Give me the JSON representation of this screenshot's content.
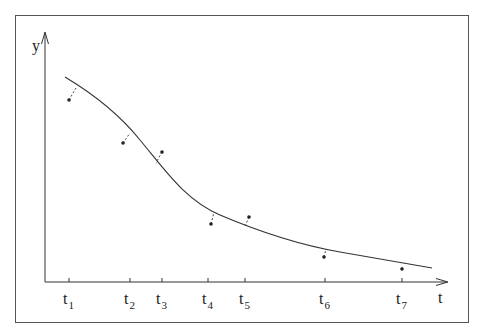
{
  "diagram": {
    "axes": {
      "y_label": "y",
      "x_label": "t"
    },
    "ticks": [
      {
        "base": "t",
        "sub": "1",
        "x": 69
      },
      {
        "base": "t",
        "sub": "2",
        "x": 130
      },
      {
        "base": "t",
        "sub": "3",
        "x": 162
      },
      {
        "base": "t",
        "sub": "4",
        "x": 208
      },
      {
        "base": "t",
        "sub": "5",
        "x": 245
      },
      {
        "base": "t",
        "sub": "6",
        "x": 325
      },
      {
        "base": "t",
        "sub": "7",
        "x": 402
      }
    ],
    "points": [
      {
        "x": 69,
        "y": 100,
        "cx": 76,
        "cy": 88
      },
      {
        "x": 123,
        "y": 143,
        "cx": 130,
        "cy": 133
      },
      {
        "x": 162,
        "y": 152,
        "cx": 156,
        "cy": 163
      },
      {
        "x": 211,
        "y": 224,
        "cx": 214,
        "cy": 212
      },
      {
        "x": 249,
        "y": 217,
        "cx": 245,
        "cy": 226
      },
      {
        "x": 324,
        "y": 257,
        "cx": 326,
        "cy": 249
      },
      {
        "x": 402,
        "y": 269,
        "cx": 402,
        "cy": 265
      }
    ],
    "colors": {
      "line": "#333333",
      "frame": "#555555"
    }
  }
}
